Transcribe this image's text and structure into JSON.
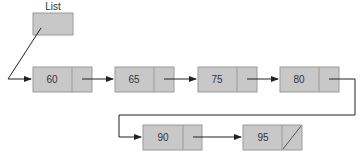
{
  "diagram": {
    "type": "singly-linked-list",
    "head": {
      "label": "List"
    },
    "nodes": [
      {
        "value": "60",
        "next": "65"
      },
      {
        "value": "65",
        "next": "75"
      },
      {
        "value": "75",
        "next": "80"
      },
      {
        "value": "80",
        "next": "90"
      },
      {
        "value": "90",
        "next": "95"
      },
      {
        "value": "95",
        "next": null
      }
    ],
    "colors": {
      "node_fill": "#c8c8c8",
      "node_border": "#9a9a9a",
      "line": "#222222"
    }
  }
}
